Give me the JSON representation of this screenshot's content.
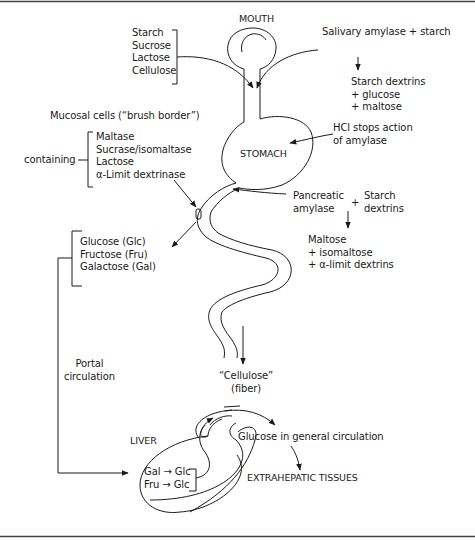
{
  "diagram": {
    "type": "carbohydrate-digestion-flow",
    "organs": {
      "mouth": "MOUTH",
      "stomach": "STOMACH",
      "liver": "LIVER"
    },
    "dietary_carbohydrates": [
      "Starch",
      "Sucrose",
      "Lactose",
      "Cellulose"
    ],
    "mouth_action": {
      "input": "Salivary amylase + starch",
      "products": [
        "Starch dextrins",
        "+ glucose",
        "+ maltose"
      ]
    },
    "stomach_action": {
      "lines": [
        "HCl stops action",
        "of amylase"
      ]
    },
    "pancreatic_action": {
      "enzyme": [
        "Pancreatic",
        "amylase"
      ],
      "plus": "+",
      "substrate": [
        "Starch",
        "dextrins"
      ],
      "products": [
        "Maltose",
        "+ isomaltose",
        "+ α-limit dextrins"
      ]
    },
    "mucosal_cells": {
      "title": "Mucosal cells (“brush border”)",
      "containing_label": "containing",
      "enzymes": [
        "Maltase",
        "Sucrase/isomaltase",
        "Lactose",
        "α-Limit dextrinase"
      ]
    },
    "absorbed_monosaccharides": [
      "Glucose (Glc)",
      "Fructose (Fru)",
      "Galactose (Gal)"
    ],
    "portal": [
      "Portal",
      "circulation"
    ],
    "fiber": [
      "“Cellulose”",
      "(fiber)"
    ],
    "liver_conversions": [
      {
        "from": "Gal",
        "arrow": "→",
        "to": "Glc"
      },
      {
        "from": "Fru",
        "arrow": "→",
        "to": "Glc"
      }
    ],
    "general_circulation": "Glucose in general circulation",
    "extrahepatic": "EXTRAHEPATIC TISSUES"
  }
}
